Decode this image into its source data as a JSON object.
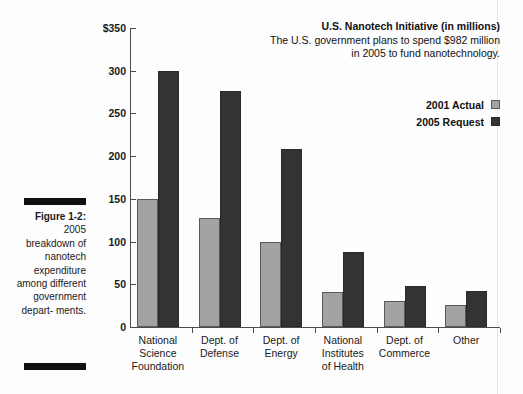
{
  "figure": {
    "caption_title": "Figure 1-2:",
    "caption_body": "2005 breakdown of nanotech expenditure among different government depart- ments."
  },
  "chart_data": {
    "type": "bar",
    "title": "U.S. Nanotech Initiative (in millions)",
    "subtitle": "The U.S. government plans to spend $982 million in 2005 to fund nanotechnology.",
    "xlabel": "",
    "ylabel": "",
    "ylim": [
      0,
      350
    ],
    "yticks": [
      0,
      50,
      100,
      150,
      200,
      250,
      300,
      350
    ],
    "ytick_labels": [
      "0",
      "50",
      "100",
      "150",
      "200",
      "250",
      "300",
      "$350"
    ],
    "grid": false,
    "legend_position": "top-right",
    "categories": [
      "National Science Foundation",
      "Dept. of Defense",
      "Dept. of Energy",
      "National Institutes of Health",
      "Dept. of Commerce",
      "Other"
    ],
    "category_lines": [
      [
        "National",
        "Science",
        "Foundation"
      ],
      [
        "Dept. of",
        "Defense"
      ],
      [
        "Dept. of",
        "Energy"
      ],
      [
        "National",
        "Institutes",
        "of Health"
      ],
      [
        "Dept. of",
        "Commerce"
      ],
      [
        "Other"
      ]
    ],
    "series": [
      {
        "name": "2001 Actual",
        "color": "#a3a3a3",
        "values": [
          150,
          128,
          99,
          41,
          30,
          26
        ]
      },
      {
        "name": "2005 Request",
        "color": "#333333",
        "values": [
          300,
          276,
          208,
          88,
          48,
          42
        ]
      }
    ]
  }
}
